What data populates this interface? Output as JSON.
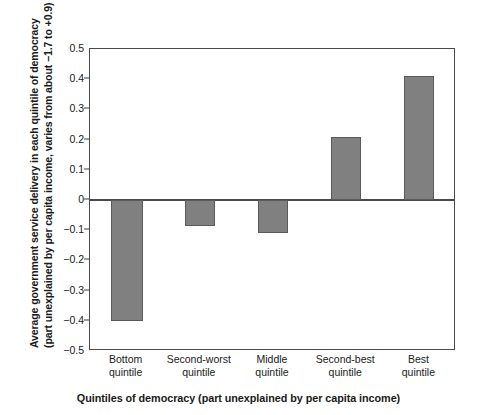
{
  "chart_data": {
    "type": "bar",
    "title": "",
    "subtitle": "",
    "categories": [
      "Bottom quintile",
      "Second-worst quintile",
      "Middle quintile",
      "Second-best quintile",
      "Best quintile"
    ],
    "category_lines": [
      [
        "Bottom",
        "quintile"
      ],
      [
        "Second-worst",
        "quintile"
      ],
      [
        "Middle",
        "quintile"
      ],
      [
        "Second-best",
        "quintile"
      ],
      [
        "Best",
        "quintile"
      ]
    ],
    "values": [
      -0.4,
      -0.085,
      -0.11,
      0.21,
      0.41
    ],
    "xlabel": "Quintiles of democracy (part unexplained by per capita income)",
    "ylabel_line1": "Average government service delivery in each quintile of democracy",
    "ylabel_line2": "(part unexplained by per capita income, varies from about −1.7 to +0.9)",
    "ylim": [
      -0.5,
      0.5
    ],
    "yticks": [
      0.5,
      0.4,
      0.3,
      0.2,
      0.1,
      0,
      -0.1,
      -0.2,
      -0.3,
      -0.4,
      -0.5
    ],
    "ytick_labels": [
      "0.5",
      "0.4",
      "0.3",
      "0.2",
      "0.1",
      "0",
      "−0.1",
      "−0.2",
      "−0.3",
      "−0.4",
      "−0.5"
    ],
    "grid": false,
    "legend": null,
    "bar_color": "#808080",
    "bar_edge_color": "#5a5a5a",
    "axis_color": "#4a4a4a",
    "zero_reference": 0
  }
}
